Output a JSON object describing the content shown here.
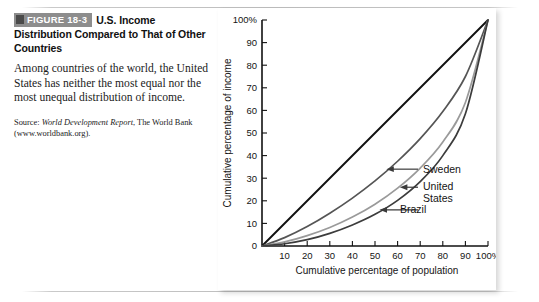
{
  "figure": {
    "badge": "FIGURE 18-3",
    "title_rest": "U.S. Income Distribution Compared to That of Other Countries",
    "body": "Among countries of the world, the United States has neither the most equal nor the most unequal distribution of income.",
    "source_prefix": "Source: ",
    "source_italic": "World Development Report",
    "source_rest": ", The World Bank (www.worldbank.org)."
  },
  "chart_data": {
    "type": "line",
    "title": "",
    "xlabel": "Cumulative percentage of population",
    "ylabel": "Cumulative percentage of income",
    "xlim": [
      0,
      100
    ],
    "ylim": [
      0,
      100
    ],
    "grid": false,
    "legend_position": "inline-annotations",
    "xticks": [
      "0",
      "10",
      "20",
      "30",
      "40",
      "50",
      "60",
      "70",
      "80",
      "90",
      "100%"
    ],
    "yticks": [
      "0",
      "10",
      "20",
      "30",
      "40",
      "50",
      "60",
      "70",
      "80",
      "90",
      "100%"
    ],
    "x": [
      0,
      10,
      20,
      30,
      40,
      50,
      60,
      70,
      80,
      90,
      100
    ],
    "series": [
      {
        "name": "Line of equality",
        "color": "#111111",
        "values": [
          0,
          10,
          20,
          30,
          40,
          50,
          60,
          70,
          80,
          90,
          100
        ]
      },
      {
        "name": "Sweden",
        "color": "#555555",
        "values": [
          0,
          3.7,
          8.6,
          14.5,
          21.2,
          28.8,
          37.5,
          47.5,
          59.5,
          75.0,
          100
        ]
      },
      {
        "name": "United States",
        "color": "#9a9a9a",
        "values": [
          0,
          1.8,
          4.6,
          8.2,
          12.8,
          18.5,
          25.6,
          34.5,
          46.0,
          63.5,
          100
        ]
      },
      {
        "name": "Brazil",
        "color": "#3c3c3c",
        "values": [
          0,
          1.0,
          2.8,
          5.6,
          9.3,
          14.0,
          20.2,
          28.5,
          40.0,
          58.5,
          100
        ]
      }
    ],
    "annotations": [
      {
        "label": "Sweden",
        "target_x": 55,
        "target_y": 34
      },
      {
        "label_line1": "United",
        "label_line2": "States",
        "target_x": 61,
        "target_y": 26
      },
      {
        "label": "Brazil",
        "target_x": 52,
        "target_y": 16
      }
    ]
  }
}
